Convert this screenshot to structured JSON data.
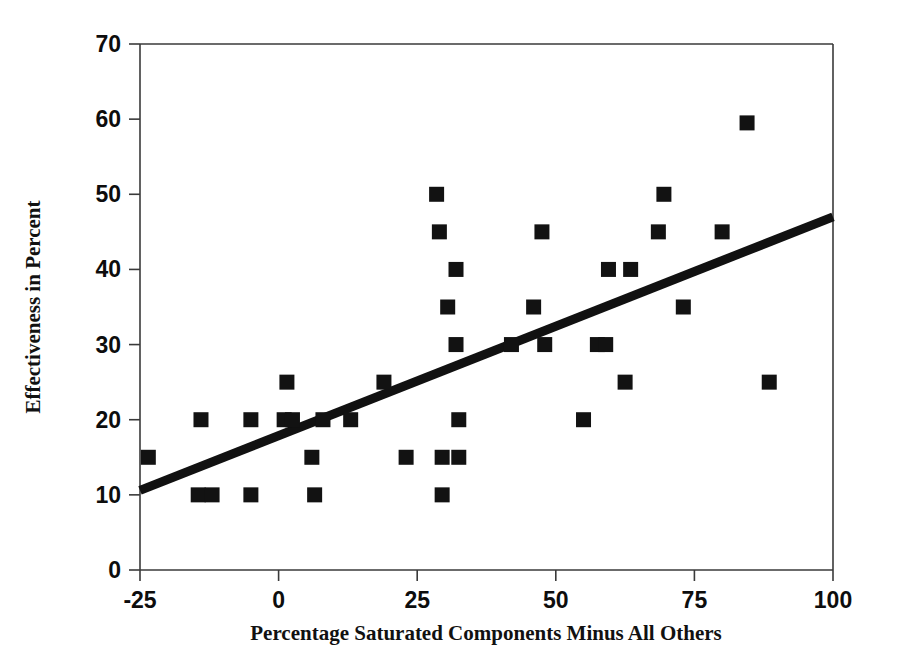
{
  "chart_data": {
    "type": "scatter",
    "title": "",
    "xlabel": "Percentage Saturated Components Minus All Others",
    "ylabel": "Effectiveness in Percent",
    "xlim": [
      -25,
      100
    ],
    "ylim": [
      0,
      70
    ],
    "xticks": [
      -25,
      0,
      25,
      50,
      75,
      100
    ],
    "yticks": [
      0,
      10,
      20,
      30,
      40,
      50,
      60,
      70
    ],
    "xtick_labels": [
      "-25",
      "0",
      "25",
      "50",
      "75",
      "100"
    ],
    "ytick_labels": [
      "0",
      "10",
      "20",
      "30",
      "40",
      "50",
      "60",
      "70"
    ],
    "grid": false,
    "legend": false,
    "marker_style": "filled-square",
    "marker_color": "#121212",
    "series": [
      {
        "name": "Observations",
        "points": [
          [
            -23.5,
            15.0
          ],
          [
            -14.0,
            20.0
          ],
          [
            -14.5,
            10.0
          ],
          [
            -12.0,
            10.0
          ],
          [
            -5.0,
            20.0
          ],
          [
            -5.0,
            10.0
          ],
          [
            1.5,
            25.0
          ],
          [
            1.0,
            20.0
          ],
          [
            2.5,
            20.0
          ],
          [
            6.0,
            15.0
          ],
          [
            6.5,
            10.0
          ],
          [
            8.0,
            20.0
          ],
          [
            13.0,
            20.0
          ],
          [
            19.0,
            25.0
          ],
          [
            23.0,
            15.0
          ],
          [
            28.5,
            50.0
          ],
          [
            29.0,
            45.0
          ],
          [
            29.5,
            15.0
          ],
          [
            29.5,
            10.0
          ],
          [
            30.5,
            35.0
          ],
          [
            32.0,
            40.0
          ],
          [
            32.0,
            30.0
          ],
          [
            32.5,
            20.0
          ],
          [
            32.5,
            15.0
          ],
          [
            42.0,
            30.0
          ],
          [
            46.0,
            35.0
          ],
          [
            47.5,
            45.0
          ],
          [
            48.0,
            30.0
          ],
          [
            55.0,
            20.0
          ],
          [
            57.5,
            30.0
          ],
          [
            59.0,
            30.0
          ],
          [
            59.5,
            40.0
          ],
          [
            62.5,
            25.0
          ],
          [
            63.5,
            40.0
          ],
          [
            68.5,
            45.0
          ],
          [
            69.5,
            50.0
          ],
          [
            73.0,
            35.0
          ],
          [
            80.0,
            45.0
          ],
          [
            84.5,
            59.5
          ],
          [
            88.5,
            25.0
          ]
        ]
      }
    ],
    "trendline": {
      "name": "Linear fit",
      "x_start": -25,
      "y_start": 10.6,
      "x_end": 100,
      "y_end": 47.0
    }
  },
  "figure": {
    "background_color": "#ffffff",
    "foreground_color": "#111111"
  }
}
